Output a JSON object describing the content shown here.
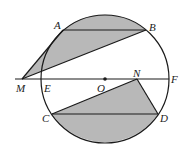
{
  "diagram": {
    "type": "geometry",
    "colors": {
      "stroke": "#1a1a1a",
      "shade": "#b8b8b8",
      "background": "#ffffff"
    },
    "circle": {
      "center": "O",
      "cx": 105,
      "cy": 79,
      "r": 64
    },
    "points": [
      {
        "name": "A",
        "x": 63,
        "y": 30,
        "label_x": 54,
        "label_y": 29
      },
      {
        "name": "B",
        "x": 146,
        "y": 30,
        "label_x": 149,
        "label_y": 31
      },
      {
        "name": "M",
        "x": 22,
        "y": 79,
        "label_x": 16,
        "label_y": 92
      },
      {
        "name": "E",
        "x": 41,
        "y": 79,
        "label_x": 44,
        "label_y": 92
      },
      {
        "name": "O",
        "x": 105,
        "y": 79,
        "label_x": 97,
        "label_y": 92
      },
      {
        "name": "N",
        "x": 137,
        "y": 79,
        "label_x": 133,
        "label_y": 77
      },
      {
        "name": "F",
        "x": 169,
        "y": 79,
        "label_x": 171,
        "label_y": 83
      },
      {
        "name": "C",
        "x": 52,
        "y": 114,
        "label_x": 42,
        "label_y": 122
      },
      {
        "name": "D",
        "x": 158,
        "y": 114,
        "label_x": 160,
        "label_y": 122
      }
    ],
    "segments": [
      "MF",
      "AB",
      "CD",
      "MA",
      "MB",
      "CN",
      "ND"
    ],
    "shaded_regions": [
      "Region bounded by MA, arc AB (top), and BM",
      "Region bounded by CN, ND, and arc DC (bottom)"
    ]
  }
}
